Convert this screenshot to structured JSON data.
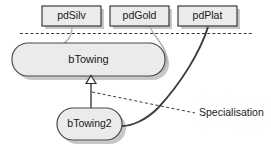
{
  "diagram": {
    "colors": {
      "node_fill": "#ebebeb",
      "node_stroke": "#2b2b2b",
      "association_gray": "#b0b0b0",
      "association_dark": "#3a3a3a",
      "text": "#1a1a1a",
      "background": "#ffffff"
    },
    "boxes": [
      {
        "id": "pdSilv",
        "label": "pdSilv"
      },
      {
        "id": "pdGold",
        "label": "pdGold"
      },
      {
        "id": "pdPlat",
        "label": "pdPlat"
      }
    ],
    "classes": [
      {
        "id": "bTowing",
        "label": "bTowing"
      },
      {
        "id": "bTowing2",
        "label": "bTowing2"
      }
    ],
    "annotations": [
      {
        "id": "specialisation",
        "label": "Specialisation"
      }
    ],
    "relations": [
      {
        "from": "pdSilv",
        "to": "bTowing",
        "style": "gray-curve"
      },
      {
        "from": "pdGold",
        "to": "bTowing",
        "style": "gray-curve"
      },
      {
        "from": "pdPlat",
        "to": "bTowing2",
        "style": "dark-curve"
      },
      {
        "from": "bTowing2",
        "to": "bTowing",
        "style": "generalisation"
      }
    ],
    "separator": {
      "id": "layer-divider",
      "style": "dashed"
    }
  }
}
